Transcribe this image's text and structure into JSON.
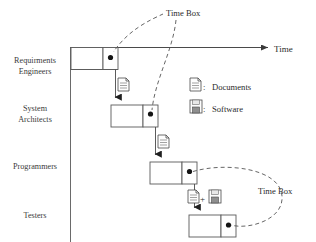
{
  "diagram": {
    "type": "staircase-waterfall-timebox",
    "axis": {
      "time_label": "Time",
      "vertical_axis_name": "roles-axis"
    },
    "lanes": [
      {
        "id": "requirements-engineers",
        "line1": "Requirments",
        "line2": "Engineers"
      },
      {
        "id": "system-architects",
        "line1": "System",
        "line2": "Architects"
      },
      {
        "id": "programmers",
        "line1": "Programmers",
        "line2": ""
      },
      {
        "id": "testers",
        "line1": "Testers",
        "line2": ""
      }
    ],
    "phases": [
      {
        "id": "phase-r",
        "letter": "R",
        "lane": "requirements-engineers"
      },
      {
        "id": "phase-d",
        "letter": "D",
        "lane": "system-architects"
      },
      {
        "id": "phase-c",
        "letter": "C",
        "lane": "programmers"
      },
      {
        "id": "phase-t",
        "letter": "T",
        "lane": "testers"
      }
    ],
    "artifacts": [
      {
        "id": "artifact-r-to-d",
        "kind": "document"
      },
      {
        "id": "artifact-d-to-c",
        "kind": "document"
      },
      {
        "id": "artifact-c-to-t",
        "kind": "document-plus-software",
        "separator": "+"
      }
    ],
    "annotations": [
      {
        "id": "timebox-top",
        "text": "Time Box"
      },
      {
        "id": "timebox-right",
        "text": "Time Box"
      }
    ],
    "legend": [
      {
        "id": "legend-documents",
        "icon": "document-icon",
        "separator": ":",
        "label": "Documents"
      },
      {
        "id": "legend-software",
        "icon": "floppy-disk-icon",
        "separator": ":",
        "label": "Software"
      }
    ],
    "colors": {
      "stroke": "#4a4a4a",
      "text": "#2b2b2b",
      "milestone": "#1a1a1a",
      "dashed": "#555555",
      "background": "#ffffff"
    }
  }
}
